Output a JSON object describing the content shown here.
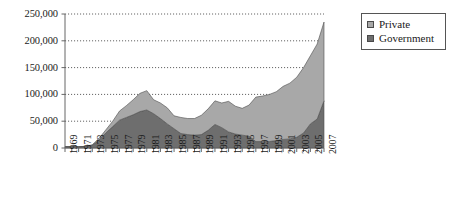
{
  "chart_data": {
    "type": "area",
    "stacked": true,
    "title": "",
    "subtitle": "",
    "xlabel": "",
    "ylabel": "",
    "grid": true,
    "gridline_style": "dotted-horizontal",
    "legend_position": "right",
    "ylim": [
      0,
      250000
    ],
    "ytick_labels": [
      "250,000",
      "200,000",
      "150,000",
      "100,000",
      "50,000",
      "0"
    ],
    "ytick_values": [
      250000,
      200000,
      150000,
      100000,
      50000,
      0
    ],
    "xlim": [
      1969,
      2007
    ],
    "xtick_labels": [
      "1969",
      "1971",
      "1973",
      "1975",
      "1977",
      "1979",
      "1981",
      "1983",
      "1985",
      "1987",
      "1989",
      "1991",
      "1993",
      "1995",
      "1997",
      "1999",
      "2001",
      "2003",
      "2005",
      "2007"
    ],
    "x": [
      1969,
      1970,
      1971,
      1972,
      1973,
      1974,
      1975,
      1976,
      1977,
      1978,
      1979,
      1980,
      1981,
      1982,
      1983,
      1984,
      1985,
      1986,
      1987,
      1988,
      1989,
      1990,
      1991,
      1992,
      1993,
      1994,
      1995,
      1996,
      1997,
      1998,
      1999,
      2000,
      2001,
      2002,
      2003,
      2004,
      2005,
      2006,
      2007
    ],
    "categories": [
      1969,
      1970,
      1971,
      1972,
      1973,
      1974,
      1975,
      1976,
      1977,
      1978,
      1979,
      1980,
      1981,
      1982,
      1983,
      1984,
      1985,
      1986,
      1987,
      1988,
      1989,
      1990,
      1991,
      1992,
      1993,
      1994,
      1995,
      1996,
      1997,
      1998,
      1999,
      2000,
      2001,
      2002,
      2003,
      2004,
      2005,
      2006,
      2007
    ],
    "series": [
      {
        "name": "Government",
        "color": "#6e6e6e",
        "stack_order": 0,
        "values": [
          2500,
          2500,
          2500,
          3000,
          5000,
          15000,
          28000,
          40000,
          52000,
          57000,
          62000,
          68000,
          71000,
          64000,
          55000,
          45000,
          36000,
          27000,
          25000,
          24000,
          25000,
          33000,
          44000,
          38000,
          30000,
          26000,
          24000,
          22000,
          12000,
          12000,
          12000,
          14000,
          16000,
          17000,
          20000,
          28000,
          45000,
          54000,
          88000
        ]
      },
      {
        "name": "Private",
        "color": "#a8a8a8",
        "stack_order": 1,
        "values": [
          0,
          0,
          0,
          0,
          1000,
          3000,
          6000,
          10000,
          17000,
          22000,
          28000,
          34000,
          36000,
          26000,
          29000,
          30000,
          24000,
          30000,
          30000,
          31000,
          36000,
          40000,
          44000,
          46000,
          57000,
          52000,
          50000,
          58000,
          83000,
          85000,
          88000,
          91000,
          99000,
          104000,
          112000,
          122000,
          127000,
          140000,
          147000
        ]
      }
    ],
    "totals": [
      2500,
      2500,
      2500,
      3000,
      6000,
      18000,
      34000,
      50000,
      69000,
      79000,
      90000,
      102000,
      107000,
      90000,
      84000,
      75000,
      60000,
      57000,
      55000,
      55000,
      61000,
      73000,
      88000,
      84000,
      87000,
      78000,
      74000,
      80000,
      95000,
      97000,
      100000,
      105000,
      115000,
      121000,
      132000,
      150000,
      172000,
      194000,
      235000
    ]
  },
  "legend": {
    "items": [
      {
        "label": "Private",
        "color": "#a8a8a8"
      },
      {
        "label": "Government",
        "color": "#6e6e6e"
      }
    ]
  }
}
